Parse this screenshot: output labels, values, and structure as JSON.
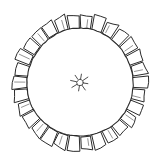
{
  "image": {
    "kind": "line-drawing",
    "subject": "rosette",
    "background_color": "#ffffff",
    "ink_color": "#2b2b2b",
    "width": 161,
    "height": 164
  },
  "figure": {
    "center_x": 80,
    "center_y": 82.5,
    "inner_circle": {
      "name": "inner-circle",
      "radius_x": 53,
      "radius_y": 54,
      "stroke_width": 1.1
    },
    "outer_ring": {
      "name": "lobed-ring",
      "lobe_count": 30,
      "inner_radius": 53,
      "outer_radius": 67,
      "lobe_gap_degrees": 1.6,
      "radius_jitter": 2.2
    },
    "center_motif": {
      "name": "sun-star",
      "ray_count": 8,
      "core_radius": 3.2,
      "ray_inner": 3.6,
      "ray_outer": 8.2
    }
  },
  "labels": {
    "title": "",
    "caption": ""
  }
}
